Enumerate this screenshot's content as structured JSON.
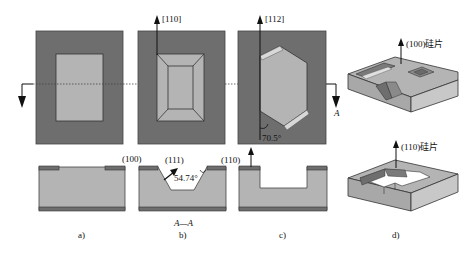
{
  "figure": {
    "panels": [
      {
        "id": "a",
        "caption": "a)"
      },
      {
        "id": "b",
        "caption": "b)"
      },
      {
        "id": "c",
        "caption": "c)"
      },
      {
        "id": "d",
        "caption": "d)"
      }
    ],
    "directions": {
      "b_top": "[110]",
      "c_top": "[112]"
    },
    "section": {
      "marker": "A",
      "label": "A—A"
    },
    "planes": {
      "a_bottom": "(100)",
      "b_bottom": "(111)",
      "c_bottom": "(110)"
    },
    "angles": {
      "b": "54.74°",
      "c": "70.5°"
    },
    "wafers": {
      "top": "(100)硅片",
      "bottom": "(110)硅片"
    },
    "colors": {
      "mask_dark": "#6e6e6e",
      "silicon_light": "#b4b4b4",
      "edge": "#333333",
      "white": "#ffffff"
    }
  }
}
